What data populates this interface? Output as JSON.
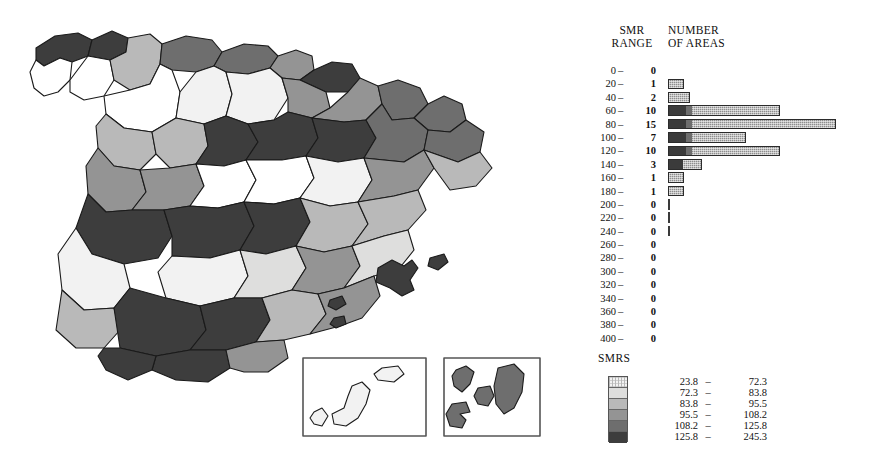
{
  "figure": {
    "kind": "choropleth-map-with-histogram-and-legend"
  },
  "histogram": {
    "header_range": "SMR\nRANGE",
    "header_range_line1": "SMR",
    "header_range_line2": "RANGE",
    "header_count_line1": "NUMBER",
    "header_count_line2": "OF AREAS",
    "dash": "–",
    "rows": [
      {
        "range": "0",
        "count": 0
      },
      {
        "range": "20",
        "count": 1
      },
      {
        "range": "40",
        "count": 2
      },
      {
        "range": "60",
        "count": 10
      },
      {
        "range": "80",
        "count": 15
      },
      {
        "range": "100",
        "count": 7
      },
      {
        "range": "120",
        "count": 10
      },
      {
        "range": "140",
        "count": 3
      },
      {
        "range": "160",
        "count": 1
      },
      {
        "range": "180",
        "count": 1
      },
      {
        "range": "200",
        "count": 0
      },
      {
        "range": "220",
        "count": 0
      },
      {
        "range": "240",
        "count": 0
      },
      {
        "range": "260",
        "count": 0
      },
      {
        "range": "280",
        "count": 0
      },
      {
        "range": "300",
        "count": 0
      },
      {
        "range": "320",
        "count": 0
      },
      {
        "range": "340",
        "count": 0
      },
      {
        "range": "360",
        "count": 0
      },
      {
        "range": "380",
        "count": 0
      },
      {
        "range": "400",
        "count": 0
      }
    ]
  },
  "legend": {
    "title": "SMRS",
    "classes": [
      {
        "low": "23.8",
        "high": "72.3",
        "color": "#f2f2f2"
      },
      {
        "low": "72.3",
        "high": "83.8",
        "color": "#dededd"
      },
      {
        "low": "83.8",
        "high": "95.5",
        "color": "#b9b9b9"
      },
      {
        "low": "95.5",
        "high": "108.2",
        "color": "#949494"
      },
      {
        "low": "108.2",
        "high": "125.8",
        "color": "#6e6e6e"
      },
      {
        "low": "125.8",
        "high": "245.3",
        "color": "#3d3d3d"
      }
    ],
    "dash": "–"
  },
  "chart_data": {
    "type": "bar",
    "xlabel": "NUMBER OF AREAS",
    "ylabel": "SMR RANGE",
    "orientation": "horizontal",
    "categories": [
      "0",
      "20",
      "40",
      "60",
      "80",
      "100",
      "120",
      "140",
      "160",
      "180",
      "200",
      "220",
      "240",
      "260",
      "280",
      "300",
      "320",
      "340",
      "360",
      "380",
      "400"
    ],
    "values": [
      0,
      1,
      2,
      10,
      15,
      7,
      10,
      3,
      1,
      1,
      0,
      0,
      0,
      0,
      0,
      0,
      0,
      0,
      0,
      0,
      0
    ],
    "xlim": [
      0,
      15
    ],
    "grid": false,
    "legend": "none",
    "total_areas": 50
  },
  "map": {
    "name": "spain-provinces-smr-choropleth",
    "inset_left_name": "balearic-inset",
    "inset_right_name": "canary-inset",
    "regions": [
      {
        "id": "r1",
        "fill": "#3d3d3d"
      },
      {
        "id": "r2",
        "fill": "#b9b9b9"
      },
      {
        "id": "r3",
        "fill": "#f2f2f2"
      },
      {
        "id": "r4",
        "fill": "#6e6e6e"
      },
      {
        "id": "r5",
        "fill": "#949494"
      },
      {
        "id": "r6",
        "fill": "#dededd"
      },
      {
        "id": "r7",
        "fill": "#3d3d3d"
      },
      {
        "id": "r8",
        "fill": "#b9b9b9"
      },
      {
        "id": "r9",
        "fill": "#f2f2f2"
      },
      {
        "id": "r10",
        "fill": "#6e6e6e"
      }
    ]
  }
}
